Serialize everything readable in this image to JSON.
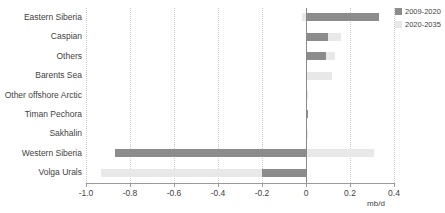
{
  "chart_data": {
    "type": "bar",
    "orientation": "horizontal",
    "title": "",
    "xlabel": "mb/d",
    "ylabel": "",
    "xlim": [
      -1.0,
      0.4
    ],
    "xticks": [
      "-1.0",
      "-0.8",
      "-0.6",
      "-0.4",
      "-0.2",
      "0",
      "0.2",
      "0.4"
    ],
    "xtick_values": [
      -1.0,
      -0.8,
      -0.6,
      -0.4,
      -0.2,
      0,
      0.2,
      0.4
    ],
    "grid": "vertical-dotted",
    "legend_position": "top-right",
    "categories": [
      "Eastern Siberia",
      "Caspian",
      "Others",
      "Barents Sea",
      "Other offshore Arctic",
      "Timan Pechora",
      "Sakhalin",
      "Western Siberia",
      "Volga Urals"
    ],
    "series": [
      {
        "name": "2009-2020",
        "color": "#8c8c8c",
        "values": [
          0.33,
          0.1,
          0.09,
          0.0,
          0.0,
          0.01,
          0.0,
          -0.87,
          -0.2
        ]
      },
      {
        "name": "2020-2035",
        "color": "#e8e8e8",
        "values": [
          -0.02,
          0.16,
          0.13,
          0.12,
          0.01,
          0.0,
          0.01,
          0.31,
          -0.93
        ]
      }
    ]
  },
  "legend": {
    "items": [
      {
        "label": "2009-2020",
        "color": "#8c8c8c"
      },
      {
        "label": "2020-2035",
        "color": "#e8e8e8"
      }
    ]
  },
  "axis": {
    "unit_label": "mb/d"
  }
}
